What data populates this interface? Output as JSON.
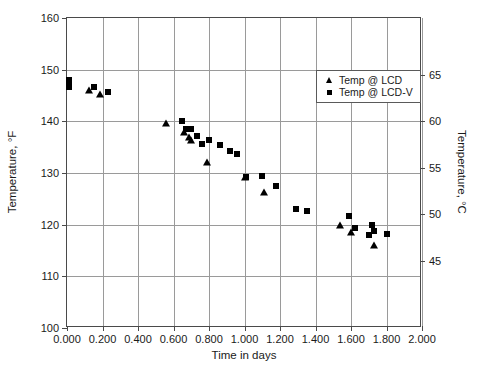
{
  "chart_data": {
    "type": "scatter",
    "title": "",
    "xlabel": "Time in days",
    "ylabel": "Temperature, °F",
    "ylabel_secondary": "Temperature, °C",
    "xlim": [
      0.0,
      2.0
    ],
    "ylim": [
      100,
      160
    ],
    "ylim_secondary": [
      37.8,
      71.1
    ],
    "xticks": [
      "0.000",
      "0.200",
      "0.400",
      "0.600",
      "0.800",
      "1.000",
      "1.200",
      "1.400",
      "1.600",
      "1.800",
      "2.000"
    ],
    "xtick_values": [
      0.0,
      0.2,
      0.4,
      0.6,
      0.8,
      1.0,
      1.2,
      1.4,
      1.6,
      1.8,
      2.0
    ],
    "yticks": [
      "100",
      "110",
      "120",
      "130",
      "140",
      "150",
      "160"
    ],
    "ytick_values": [
      100,
      110,
      120,
      130,
      140,
      150,
      160
    ],
    "yticks_secondary": [
      "45",
      "50",
      "55",
      "60",
      "65"
    ],
    "ytick_values_secondary": [
      45,
      50,
      55,
      60,
      65
    ],
    "grid": true,
    "legend_position": "upper right",
    "marker_color": "#000000",
    "grid_color": "#9a9a9a",
    "axis_color": "#4a4a4a",
    "series": [
      {
        "name": "Temp @ LCD",
        "marker": "triangle",
        "points": [
          [
            0.125,
            146.0
          ],
          [
            0.185,
            145.3
          ],
          [
            0.56,
            139.6
          ],
          [
            0.66,
            138.0
          ],
          [
            0.69,
            136.9
          ],
          [
            0.7,
            136.4
          ],
          [
            0.79,
            132.2
          ],
          [
            1.0,
            129.2
          ],
          [
            1.11,
            126.4
          ],
          [
            1.54,
            119.9
          ],
          [
            1.6,
            118.6
          ],
          [
            1.73,
            116.1
          ]
        ]
      },
      {
        "name": "Temp @ LCD-V",
        "marker": "square",
        "points": [
          [
            0.01,
            148.0
          ],
          [
            0.01,
            147.3
          ],
          [
            0.01,
            146.7
          ],
          [
            0.15,
            146.6
          ],
          [
            0.23,
            145.7
          ],
          [
            0.65,
            140.0
          ],
          [
            0.67,
            138.5
          ],
          [
            0.7,
            138.6
          ],
          [
            0.73,
            137.1
          ],
          [
            0.76,
            135.6
          ],
          [
            0.8,
            136.4
          ],
          [
            0.86,
            135.4
          ],
          [
            0.92,
            134.3
          ],
          [
            0.96,
            133.6
          ],
          [
            1.01,
            129.3
          ],
          [
            1.1,
            129.5
          ],
          [
            1.18,
            127.4
          ],
          [
            1.29,
            123.0
          ],
          [
            1.35,
            122.6
          ],
          [
            1.59,
            121.6
          ],
          [
            1.62,
            119.3
          ],
          [
            1.7,
            118.0
          ],
          [
            1.72,
            120.0
          ],
          [
            1.73,
            118.8
          ],
          [
            1.8,
            118.1
          ]
        ]
      }
    ]
  },
  "legend": {
    "entries": [
      {
        "label": "Temp @ LCD",
        "marker": "triangle"
      },
      {
        "label": "Temp @ LCD-V",
        "marker": "square"
      }
    ]
  }
}
